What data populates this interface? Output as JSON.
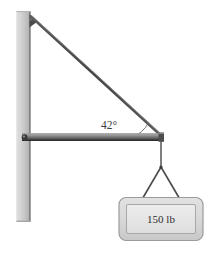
{
  "figure": {
    "background_color": "#ffffff",
    "labels": {
      "angle": "42°",
      "load": "150 lb"
    },
    "colors": {
      "wall_light": "#d5d5d5",
      "wall_mid": "#bdbdbd",
      "wall_edge": "#8a8a8a",
      "beam_dark": "#4a4a4a",
      "beam_light": "#8f8f8f",
      "cable": "#3f3f3f",
      "box_fill": "#dcdcdc",
      "box_inner": "#e6e6e6",
      "box_stroke": "#9b9b9b",
      "text": "#2e2e2e"
    },
    "parts": [
      {
        "name": "wall-post",
        "description": "vertical gray wall column at left"
      },
      {
        "name": "support-cable",
        "description": "diagonal cable from top of wall to right end of beam"
      },
      {
        "name": "horizontal-beam",
        "description": "horizontal boom pinned to the wall"
      },
      {
        "name": "pin-joint",
        "description": "pin connection of beam to wall"
      },
      {
        "name": "hanging-cable",
        "description": "vertical cable hanging from beam tip"
      },
      {
        "name": "sling-left",
        "description": "left leg of V sling to crate"
      },
      {
        "name": "sling-right",
        "description": "right leg of V sling to crate"
      },
      {
        "name": "load-box",
        "description": "suspended crate labeled with its weight"
      },
      {
        "name": "angle-arc",
        "description": "arc marking the angle between beam and cable"
      }
    ]
  }
}
